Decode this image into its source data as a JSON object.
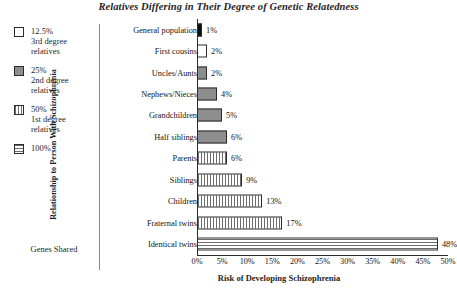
{
  "chart_data": {
    "type": "bar",
    "orientation": "horizontal",
    "title": "Relatives Differing in Their Degree of Genetic Relatedness",
    "xlabel": "Risk of Developing Schizophrenia",
    "ylabel": "Relationship to Person With Schizophrenia",
    "xlim": [
      0,
      50
    ],
    "xticks": [
      "0%",
      "5%",
      "10%",
      "15%",
      "20%",
      "25%",
      "30%",
      "35%",
      "40%",
      "45%",
      "50%"
    ],
    "xtick_values": [
      0,
      5,
      10,
      15,
      20,
      25,
      30,
      35,
      40,
      45,
      50
    ],
    "grid": false,
    "categories": [
      "General population",
      "First cousins",
      "Uncles/Aunts",
      "Nephews/Nieces",
      "Grandchildren",
      "Half siblings",
      "Parents",
      "Siblings",
      "Children",
      "Fraternal twins",
      "Identical twins"
    ],
    "values": [
      1,
      2,
      2,
      4,
      5,
      6,
      6,
      9,
      13,
      17,
      48
    ],
    "value_labels": [
      "1%",
      "2%",
      "2%",
      "4%",
      "5%",
      "6%",
      "6%",
      "9%",
      "13%",
      "17%",
      "48%"
    ],
    "bar_fills": [
      "black",
      "white",
      "gray",
      "gray",
      "gray",
      "gray",
      "vertical",
      "vertical",
      "vertical",
      "vertical",
      "horizontal"
    ],
    "legend_position": "left",
    "legend": [
      {
        "pct": "12.5%",
        "desc": "3rd degree relatives",
        "desc_line1": "3rd degree",
        "desc_line2": "relatives",
        "swatch": "empty"
      },
      {
        "pct": "25%",
        "desc": "2nd degree relatives",
        "desc_line1": "2nd degree",
        "desc_line2": "relatives",
        "swatch": "solid"
      },
      {
        "pct": "50%",
        "desc": "1st degree relatives",
        "desc_line1": "1st degree",
        "desc_line2": "relatives",
        "swatch": "vertical"
      },
      {
        "pct": "100%",
        "desc": "",
        "desc_line1": "",
        "desc_line2": "",
        "swatch": "horizontal"
      }
    ],
    "legend_caption": "Genes Shared",
    "colors": {
      "bar_black": "#0d0d0d",
      "bar_gray": "#8e8e8e",
      "bar_white": "#ffffff",
      "pattern_gray": "#6b6b6b",
      "outline": "#2b2b2b",
      "text": "#1a1a1a",
      "background": "#ffffff"
    }
  }
}
